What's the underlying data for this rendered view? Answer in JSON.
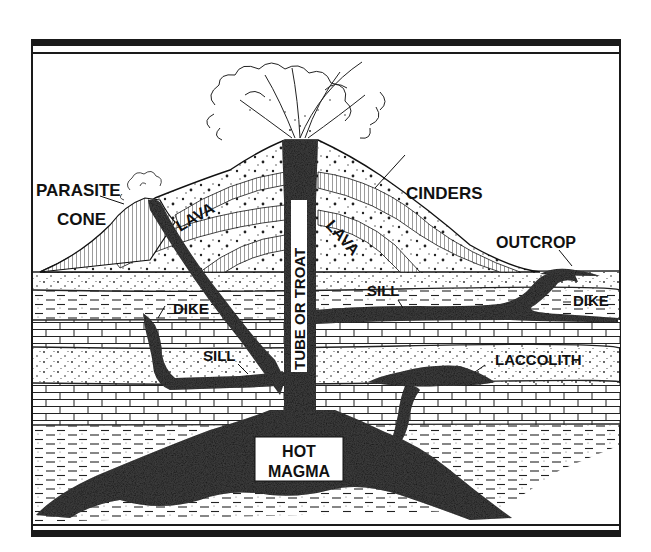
{
  "diagram": {
    "colors": {
      "ink": "#111111",
      "magma": "#1c1c1c",
      "paper": "#ffffff"
    },
    "labels": {
      "parasite_cone_line1": "PARASITE",
      "parasite_cone_line2": "CONE",
      "cinders": "CINDERS",
      "lava_left": "LAVA",
      "lava_right": "LAVA",
      "outcrop": "OUTCROP",
      "tube": "TUBE OR TROAT",
      "dike_left": "DIKE",
      "dike_right": "DIKE",
      "sill_upper": "SILL",
      "sill_lower": "SILL",
      "laccolith": "LACCOLITH",
      "magma_line1": "HOT",
      "magma_line2": "MAGMA"
    },
    "layers": [
      {
        "name": "sandstone",
        "top": 272,
        "bottom": 290
      },
      {
        "name": "shale",
        "top": 290,
        "bottom": 320
      },
      {
        "name": "limestone",
        "top": 320,
        "bottom": 347
      },
      {
        "name": "sandstone",
        "top": 347,
        "bottom": 383
      },
      {
        "name": "limestone",
        "top": 383,
        "bottom": 425
      },
      {
        "name": "shale",
        "top": 425,
        "bottom": 522
      }
    ]
  }
}
